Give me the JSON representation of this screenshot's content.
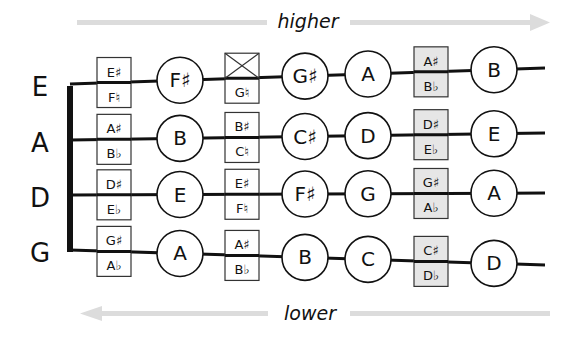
{
  "diagram": {
    "arrows": {
      "top": {
        "label": "higher",
        "direction": "right"
      },
      "bottom": {
        "label": "lower",
        "direction": "left"
      }
    },
    "colors": {
      "line": "#111111",
      "arrow": "#dcdcdc",
      "shaded_box": "#e6e6e6",
      "box": "#ffffff"
    },
    "strings": [
      {
        "name": "E",
        "frets": [
          {
            "type": "box",
            "top": "E♯",
            "bottom": "F♮",
            "shaded": false
          },
          {
            "type": "circle",
            "note": "F♯"
          },
          {
            "type": "box",
            "top": "",
            "bottom": "G♮",
            "shaded": false,
            "crossed_top": true
          },
          {
            "type": "circle",
            "note": "G♯"
          },
          {
            "type": "circle",
            "note": "A"
          },
          {
            "type": "box",
            "top": "A♯",
            "bottom": "B♭",
            "shaded": true
          },
          {
            "type": "circle",
            "note": "B"
          }
        ]
      },
      {
        "name": "A",
        "frets": [
          {
            "type": "box",
            "top": "A♯",
            "bottom": "B♭",
            "shaded": false
          },
          {
            "type": "circle",
            "note": "B"
          },
          {
            "type": "box",
            "top": "B♯",
            "bottom": "C♮",
            "shaded": false
          },
          {
            "type": "circle",
            "note": "C♯"
          },
          {
            "type": "circle",
            "note": "D"
          },
          {
            "type": "box",
            "top": "D♯",
            "bottom": "E♭",
            "shaded": true
          },
          {
            "type": "circle",
            "note": "E"
          }
        ]
      },
      {
        "name": "D",
        "frets": [
          {
            "type": "box",
            "top": "D♯",
            "bottom": "E♭",
            "shaded": false
          },
          {
            "type": "circle",
            "note": "E"
          },
          {
            "type": "box",
            "top": "E♯",
            "bottom": "F♮",
            "shaded": false
          },
          {
            "type": "circle",
            "note": "F♯"
          },
          {
            "type": "circle",
            "note": "G"
          },
          {
            "type": "box",
            "top": "G♯",
            "bottom": "A♭",
            "shaded": true
          },
          {
            "type": "circle",
            "note": "A"
          }
        ]
      },
      {
        "name": "G",
        "frets": [
          {
            "type": "box",
            "top": "G♯",
            "bottom": "A♭",
            "shaded": false
          },
          {
            "type": "circle",
            "note": "A"
          },
          {
            "type": "box",
            "top": "A♯",
            "bottom": "B♭",
            "shaded": false
          },
          {
            "type": "circle",
            "note": "B"
          },
          {
            "type": "circle",
            "note": "C"
          },
          {
            "type": "box",
            "top": "C♯",
            "bottom": "D♭",
            "shaded": true
          },
          {
            "type": "circle",
            "note": "D"
          }
        ]
      }
    ]
  }
}
